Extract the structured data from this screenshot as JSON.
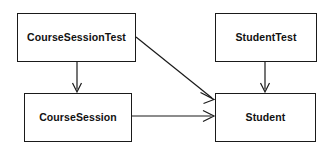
{
  "diagram": {
    "kind": "class-dependency-diagram",
    "background_color": "#ffffff",
    "line_color": "#1a1a1a",
    "text_color": "#111111",
    "width": 333,
    "height": 150,
    "nodes": [
      {
        "id": "course-session-test",
        "label": "CourseSessionTest",
        "x": 17,
        "y": 13,
        "width": 119,
        "height": 49
      },
      {
        "id": "course-session",
        "label": "CourseSession",
        "x": 24,
        "y": 93,
        "width": 108,
        "height": 49
      },
      {
        "id": "student-test",
        "label": "StudentTest",
        "x": 215,
        "y": 13,
        "width": 102,
        "height": 49
      },
      {
        "id": "student",
        "label": "Student",
        "x": 215,
        "y": 93,
        "width": 101,
        "height": 49
      }
    ],
    "edges": [
      {
        "id": "edge-course-session-test-to-course-session",
        "from": "course-session-test",
        "to": "course-session",
        "style": "solid",
        "arrowhead": "open",
        "x1": 77,
        "y1": 62,
        "x2": 77,
        "y2": 92
      },
      {
        "id": "edge-course-session-test-to-student",
        "from": "course-session-test",
        "to": "student",
        "style": "solid",
        "arrowhead": "open",
        "x1": 136,
        "y1": 37,
        "x2": 214,
        "y2": 99
      },
      {
        "id": "edge-course-session-to-student",
        "from": "course-session",
        "to": "student",
        "style": "solid",
        "arrowhead": "open",
        "x1": 132,
        "y1": 116,
        "x2": 214,
        "y2": 116
      },
      {
        "id": "edge-student-test-to-student",
        "from": "student-test",
        "to": "student",
        "style": "solid",
        "arrowhead": "open",
        "x1": 265,
        "y1": 62,
        "x2": 265,
        "y2": 92
      }
    ]
  }
}
